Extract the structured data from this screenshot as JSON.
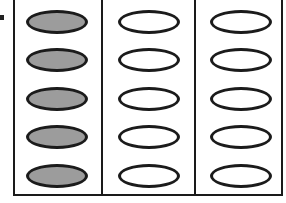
{
  "diagram": {
    "columns": 3,
    "rows": 5,
    "columns_data": [
      {
        "index": 1,
        "filled": [
          true,
          true,
          true,
          true,
          true
        ]
      },
      {
        "index": 2,
        "filled": [
          false,
          false,
          false,
          false,
          false
        ]
      },
      {
        "index": 3,
        "filled": [
          false,
          false,
          false,
          false,
          false
        ]
      }
    ],
    "colors": {
      "outline": "#1b1b1b",
      "filled_oval": "#9c9c9c",
      "empty_oval": "#ffffff",
      "background": "#ffffff"
    }
  }
}
